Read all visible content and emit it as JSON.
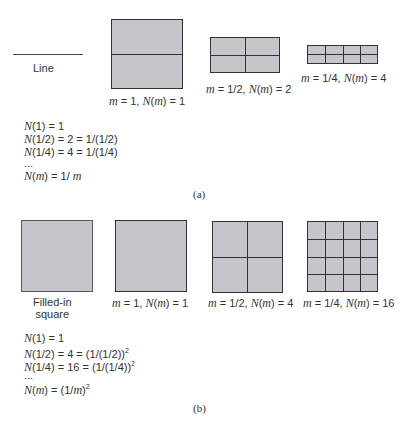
{
  "panel_a": {
    "caption": "(a)",
    "line_label": "Line",
    "figures": [
      {
        "m": "1",
        "N": "1",
        "rows": 2,
        "cols": 1
      },
      {
        "m": "1/2",
        "N": "2",
        "rows": 2,
        "cols": 2
      },
      {
        "m": "1/4",
        "N": "4",
        "rows": 2,
        "cols": 4
      }
    ],
    "equations": [
      {
        "lhs_arg": "1",
        "rhs": " = 1"
      },
      {
        "lhs_arg": "1/2",
        "rhs": " = 2 = 1/(1/2)"
      },
      {
        "lhs_arg": "1/4",
        "rhs": " = 4 = 1/(1/4)"
      },
      {
        "ellipsis": "..."
      },
      {
        "final_prefix": " = 1/ ",
        "final_var": "m"
      }
    ]
  },
  "panel_b": {
    "caption": "(b)",
    "filled_label_line1": "Filled-in",
    "filled_label_line2": "square",
    "figures": [
      {
        "m": "1",
        "N": "1",
        "grid": 1
      },
      {
        "m": "1/2",
        "N": "4",
        "grid": 2
      },
      {
        "m": "1/4",
        "N": "16",
        "grid": 4
      }
    ],
    "equations": [
      {
        "lhs_arg": "1",
        "rhs": " = 1"
      },
      {
        "lhs_arg": "1/2",
        "rhs": " = 4 = (1/(1/2))",
        "exp": "2"
      },
      {
        "lhs_arg": "1/4",
        "rhs": " = 16 = (1/(1/4))",
        "exp": "2"
      },
      {
        "ellipsis": "..."
      },
      {
        "final_open": " = (1/",
        "final_var": "m",
        "final_close": ")",
        "exp": "2"
      }
    ]
  },
  "symbols": {
    "N": "N",
    "m": "m",
    "open": "(",
    "close": ")",
    "eq": " = ",
    "comma": ", "
  },
  "colors": {
    "fill": "#c4c6ca",
    "stroke": "#333333"
  }
}
